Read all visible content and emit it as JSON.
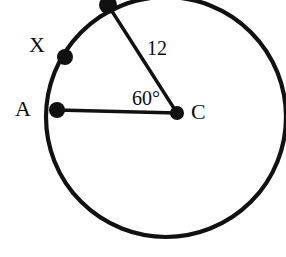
{
  "figure": {
    "background_color": "#ffffff",
    "stroke_color": "#111111",
    "width": 286,
    "height": 257
  },
  "circle": {
    "name": "circle-outline",
    "center_x": 166,
    "center_y": 117,
    "radius": 120,
    "stroke_width": 4.2
  },
  "points": [
    {
      "id": "C",
      "label": "C",
      "role": "center",
      "x": 177,
      "y": 113,
      "dot_radius": 7
    },
    {
      "id": "A",
      "label": "A",
      "role": "on-circle",
      "x": 57,
      "y": 110,
      "dot_radius": 8
    },
    {
      "id": "X",
      "label": "X",
      "role": "on-circle",
      "x": 65,
      "y": 57,
      "dot_radius": 8
    },
    {
      "id": "B",
      "label": "",
      "role": "on-circle",
      "x": 108,
      "y": 5,
      "dot_radius": 9
    }
  ],
  "segments": [
    {
      "name": "radius-C-to-A",
      "from": "C",
      "to": "A",
      "stroke_width": 3.4
    },
    {
      "name": "radius-C-to-B",
      "from": "C",
      "to": "B",
      "stroke_width": 3.4
    }
  ],
  "labels": {
    "point_a": "A",
    "point_x": "X",
    "point_c": "C",
    "radius_length": "12",
    "central_angle": "60°"
  }
}
